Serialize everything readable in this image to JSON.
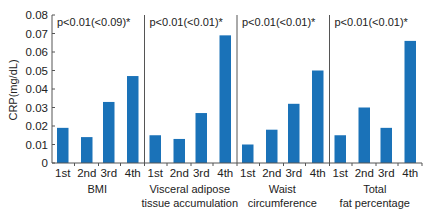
{
  "chart_data": {
    "type": "bar",
    "title": "",
    "ylabel": "CRP(mg/dL)",
    "xlabel": "",
    "ylim": [
      0,
      0.08
    ],
    "yticks": [
      "0",
      "0.01",
      "0.02",
      "0.03",
      "0.04",
      "0.05",
      "0.06",
      "0.07",
      "0.08"
    ],
    "grid": false,
    "legend": null,
    "bar_color": "#1a72b8",
    "categories": [
      "1st",
      "2nd",
      "3rd",
      "4th"
    ],
    "groups": [
      {
        "name": "BMI",
        "label_lines": [
          "BMI"
        ],
        "annotation": "p<0.01(<0.09)*",
        "values": [
          0.019,
          0.014,
          0.033,
          0.047
        ]
      },
      {
        "name": "Visceral adipose tissue accumulation",
        "label_lines": [
          "Visceral adipose",
          "tissue accumulation"
        ],
        "annotation": "p<0.01(<0.01)*",
        "values": [
          0.015,
          0.013,
          0.027,
          0.069
        ]
      },
      {
        "name": "Waist circumference",
        "label_lines": [
          "Waist",
          "circumference"
        ],
        "annotation": "p<0.01(<0.01)*",
        "values": [
          0.01,
          0.018,
          0.032,
          0.05
        ]
      },
      {
        "name": "Total fat percentage",
        "label_lines": [
          "Total",
          "fat percentage"
        ],
        "annotation": "p<0.01(<0.01)*",
        "values": [
          0.015,
          0.03,
          0.019,
          0.066
        ]
      }
    ]
  }
}
